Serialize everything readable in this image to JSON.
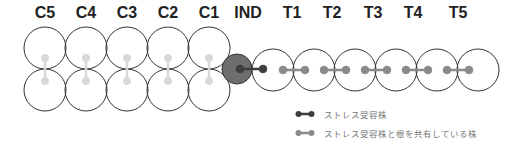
{
  "labels": {
    "C5": "C5",
    "C4": "C4",
    "C3": "C3",
    "C2": "C2",
    "C1": "C1",
    "IND": "IND",
    "T1": "T1",
    "T2": "T2",
    "T3": "T3",
    "T4": "T4",
    "T5": "T5"
  },
  "colors": {
    "circle_stroke": "#333333",
    "ind_fill": "#6e6e6e",
    "stress_plant": "#3d3d3d",
    "shared_root_plant_T": "#8a8a8a",
    "shared_root_plant_C": "#d8d8d8"
  },
  "legend": {
    "stress_receiving": "ストレス受容株",
    "shared_root": "ストレス受容株と根を共有している株"
  }
}
